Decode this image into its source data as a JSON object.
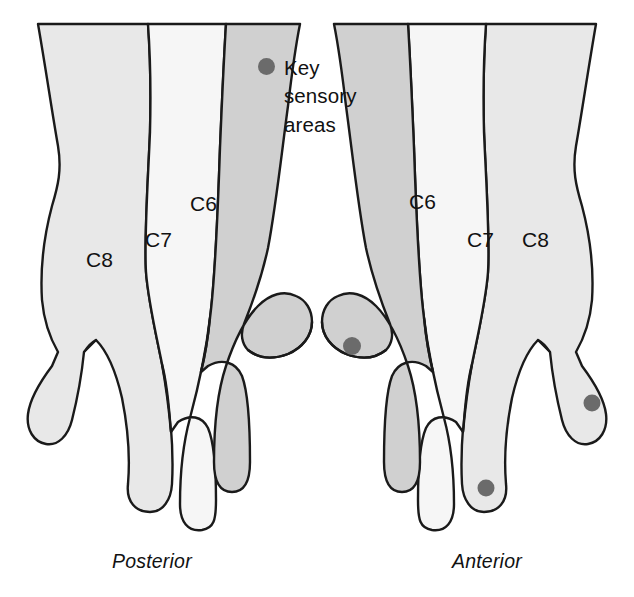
{
  "figure": {
    "background_color": "#ffffff",
    "width": 634,
    "height": 597
  },
  "legend": {
    "marker_icon": "key-sensory-dot-icon",
    "marker_color": "#6b6b6b",
    "line1": "Key",
    "line2": "sensory",
    "line3": "areas",
    "text": "Key sensory areas"
  },
  "captions": {
    "left": "Posterior",
    "right": "Anterior"
  },
  "palette": {
    "outline": "#1a1a1a",
    "c6_fill": "#d0d0d0",
    "c7_fill": "#f6f6f6",
    "c8_fill": "#e8e8e8",
    "dot_fill": "#6b6b6b",
    "background": "#ffffff"
  },
  "hands": [
    {
      "id": "left-hand",
      "view": "Posterior",
      "caption": "Posterior",
      "labels": [
        {
          "id": "posterior-c8",
          "text": "C8",
          "x": 86,
          "y": 262,
          "dermatome": "C8"
        },
        {
          "id": "posterior-c7",
          "text": "C7",
          "x": 150,
          "y": 243,
          "dermatome": "C7"
        },
        {
          "id": "posterior-c6",
          "text": "C6",
          "x": 196,
          "y": 207,
          "dermatome": "C6"
        }
      ],
      "key_sensory_dots": []
    },
    {
      "id": "right-hand",
      "view": "Anterior",
      "caption": "Anterior",
      "labels": [
        {
          "id": "anterior-c6",
          "text": "C6",
          "x": 412,
          "y": 205,
          "dermatome": "C6"
        },
        {
          "id": "anterior-c7",
          "text": "C7",
          "x": 478,
          "y": 243,
          "dermatome": "C7"
        },
        {
          "id": "anterior-c8",
          "text": "C8",
          "x": 530,
          "y": 243,
          "dermatome": "C8"
        }
      ],
      "key_sensory_dots": [
        {
          "id": "dot-thumb-c6",
          "dermatome": "C6",
          "location": "thumb",
          "x": 352,
          "y": 346,
          "r": 9
        },
        {
          "id": "dot-middle-c7",
          "dermatome": "C7",
          "location": "middle-finger",
          "x": 486,
          "y": 488,
          "r": 8.5
        },
        {
          "id": "dot-little-c8",
          "dermatome": "C8",
          "location": "little-finger",
          "x": 592,
          "y": 403,
          "r": 8.5
        }
      ]
    }
  ],
  "dermatomes": [
    {
      "code": "C6",
      "shade": "dark-gray",
      "color": "#d0d0d0"
    },
    {
      "code": "C7",
      "shade": "near-white",
      "color": "#f6f6f6"
    },
    {
      "code": "C8",
      "shade": "light-gray",
      "color": "#e8e8e8"
    }
  ]
}
